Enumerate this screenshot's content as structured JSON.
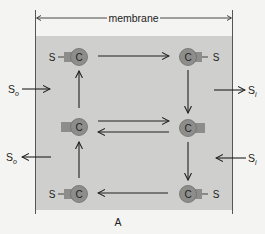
{
  "header": {
    "membrane_label": "membrane"
  },
  "figure": {
    "panel_label": "A"
  },
  "colors": {
    "background": "#f4f4f2",
    "membrane_fill": "#cfcfcd",
    "carrier_fill": "#8d8d8b",
    "carrier_stroke": "#6e6e6c",
    "line": "#222222"
  },
  "carriers": [
    {
      "id": "top-left",
      "label": "C",
      "substrate": "S",
      "tab": "left"
    },
    {
      "id": "top-right",
      "label": "C",
      "substrate": "S",
      "tab": "right"
    },
    {
      "id": "middle-left",
      "label": "C",
      "substrate": "",
      "tab": "left"
    },
    {
      "id": "middle-right",
      "label": "C",
      "substrate": "",
      "tab": "right"
    },
    {
      "id": "bottom-left",
      "label": "C",
      "substrate": "S",
      "tab": "left"
    },
    {
      "id": "bottom-right",
      "label": "C",
      "substrate": "S",
      "tab": "right"
    }
  ],
  "outside": {
    "top_label": "S",
    "top_sub": "o",
    "bottom_label": "S",
    "bottom_sub": "o"
  },
  "inside": {
    "top_label": "S",
    "top_sub": "i",
    "bottom_label": "S",
    "bottom_sub": "i"
  }
}
